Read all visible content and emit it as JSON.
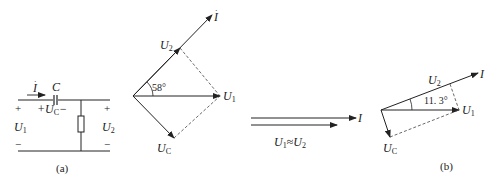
{
  "figure": {
    "panel_a": {
      "caption": "(a)",
      "circuit": {
        "current_label": "I",
        "capacitor_label": "C",
        "capacitor_voltage_label": "+U",
        "capacitor_voltage_sub": "C",
        "capacitor_voltage_minus": "−",
        "input_voltage_label": "U",
        "input_voltage_sub": "1",
        "output_voltage_label": "U",
        "output_voltage_sub": "2",
        "plus": "+",
        "minus": "−"
      },
      "phasor_diagram": {
        "angle_label": "58°",
        "vectors": [
          {
            "name": "I",
            "label": "I",
            "sub": ""
          },
          {
            "name": "U2",
            "label": "U",
            "sub": "2"
          },
          {
            "name": "U1",
            "label": "U",
            "sub": "1"
          },
          {
            "name": "UC",
            "label": "U",
            "sub": "C"
          }
        ]
      }
    },
    "middle": {
      "current_label": "I",
      "relation_label": "U",
      "relation_sub1": "1",
      "relation_approx": "≈",
      "relation_sub2": "2"
    },
    "panel_b": {
      "caption": "(b)",
      "angle_label": "11. 3°",
      "vectors": [
        {
          "name": "I",
          "label": "I",
          "sub": ""
        },
        {
          "name": "U2",
          "label": "U",
          "sub": "2"
        },
        {
          "name": "U1",
          "label": "U",
          "sub": "1"
        },
        {
          "name": "UC",
          "label": "U",
          "sub": "C"
        }
      ]
    }
  }
}
